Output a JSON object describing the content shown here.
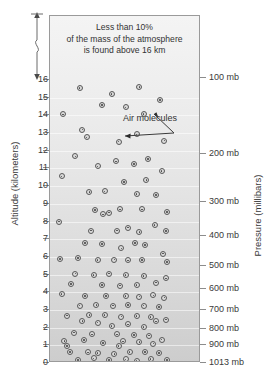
{
  "figure": {
    "annotation_lines": [
      "Less than 10%",
      "of the mass of the atmosphere",
      "is found above 16 km"
    ],
    "molecules_label": "Air molecules"
  },
  "chart_data": {
    "type": "scatter",
    "title": "",
    "subtitle": "",
    "annotation": "Less than 10% of the mass of the atmosphere is found above 16 km",
    "xlabel": "",
    "ylabel": "Altitude (kilometers)",
    "y2label": "Pressure (millibars)",
    "grid": false,
    "legend": "none",
    "ylim": [
      0,
      16
    ],
    "yticks": [
      0,
      1,
      2,
      3,
      4,
      5,
      6,
      7,
      8,
      9,
      10,
      11,
      12,
      13,
      14,
      15,
      16
    ],
    "ytick_labels": [
      "0",
      "1",
      "2",
      "3",
      "4",
      "5",
      "6",
      "7",
      "8",
      "9",
      "10",
      "11",
      "12",
      "13",
      "14",
      "15",
      "16"
    ],
    "y2_ticks_altitude_km": [
      16.1,
      11.8,
      9.1,
      7.2,
      5.5,
      4.2,
      3.0,
      1.9,
      1.0,
      0.0
    ],
    "y2_tick_labels": [
      "100 mb",
      "200 mb",
      "300 mb",
      "400 mb",
      "500 mb",
      "600 mb",
      "700 mb",
      "800 mb",
      "900 mb",
      "1013 mb"
    ],
    "points": [
      [
        0.17,
        15.55
      ],
      [
        0.6,
        15.6
      ],
      [
        0.4,
        15.22
      ],
      [
        0.75,
        14.87
      ],
      [
        0.33,
        14.6
      ],
      [
        0.5,
        14.45
      ],
      [
        0.05,
        14.05
      ],
      [
        0.63,
        14.08
      ],
      [
        0.22,
        12.75
      ],
      [
        0.19,
        13.2
      ],
      [
        0.58,
        12.93
      ],
      [
        0.45,
        12.52
      ],
      [
        0.78,
        12.57
      ],
      [
        0.14,
        11.68
      ],
      [
        0.66,
        11.55
      ],
      [
        0.3,
        11.12
      ],
      [
        0.43,
        11.4
      ],
      [
        0.56,
        11.25
      ],
      [
        0.76,
        10.86
      ],
      [
        0.04,
        10.55
      ],
      [
        0.65,
        10.35
      ],
      [
        0.49,
        10.23
      ],
      [
        0.24,
        9.67
      ],
      [
        0.35,
        9.7
      ],
      [
        0.58,
        9.57
      ],
      [
        0.72,
        9.5
      ],
      [
        0.28,
        8.65
      ],
      [
        0.38,
        8.5
      ],
      [
        0.46,
        8.68
      ],
      [
        0.62,
        8.68
      ],
      [
        0.8,
        8.55
      ],
      [
        0.02,
        8.0
      ],
      [
        0.34,
        8.4
      ],
      [
        0.25,
        7.48
      ],
      [
        0.44,
        7.48
      ],
      [
        0.52,
        7.65
      ],
      [
        0.6,
        7.42
      ],
      [
        0.71,
        7.8
      ],
      [
        0.79,
        7.45
      ],
      [
        0.21,
        6.8
      ],
      [
        0.33,
        6.72
      ],
      [
        0.47,
        6.48
      ],
      [
        0.57,
        6.78
      ],
      [
        0.64,
        6.68
      ],
      [
        0.77,
        6.18
      ],
      [
        0.03,
        5.88
      ],
      [
        0.16,
        5.95
      ],
      [
        0.3,
        5.82
      ],
      [
        0.42,
        5.85
      ],
      [
        0.52,
        5.8
      ],
      [
        0.62,
        5.82
      ],
      [
        0.8,
        5.7
      ],
      [
        0.14,
        5.05
      ],
      [
        0.27,
        4.98
      ],
      [
        0.38,
        5.05
      ],
      [
        0.5,
        4.98
      ],
      [
        0.63,
        4.92
      ],
      [
        0.72,
        4.55
      ],
      [
        0.79,
        4.78
      ],
      [
        0.11,
        4.45
      ],
      [
        0.33,
        4.42
      ],
      [
        0.46,
        4.38
      ],
      [
        0.58,
        4.4
      ],
      [
        0.04,
        3.9
      ],
      [
        0.21,
        3.8
      ],
      [
        0.36,
        3.78
      ],
      [
        0.5,
        3.78
      ],
      [
        0.6,
        3.75
      ],
      [
        0.7,
        3.82
      ],
      [
        0.78,
        3.7
      ],
      [
        0.17,
        3.25
      ],
      [
        0.29,
        3.28
      ],
      [
        0.41,
        3.25
      ],
      [
        0.52,
        3.28
      ],
      [
        0.63,
        3.25
      ],
      [
        0.74,
        3.18
      ],
      [
        0.08,
        2.68
      ],
      [
        0.19,
        2.38
      ],
      [
        0.24,
        2.7
      ],
      [
        0.35,
        2.7
      ],
      [
        0.47,
        2.62
      ],
      [
        0.58,
        2.65
      ],
      [
        0.68,
        2.6
      ],
      [
        0.79,
        2.45
      ],
      [
        0.13,
        1.72
      ],
      [
        0.3,
        2.28
      ],
      [
        0.4,
        2.08
      ],
      [
        0.52,
        2.18
      ],
      [
        0.63,
        2.05
      ],
      [
        0.72,
        2.35
      ],
      [
        0.26,
        1.62
      ],
      [
        0.44,
        1.62
      ],
      [
        0.56,
        1.58
      ],
      [
        0.67,
        1.55
      ],
      [
        0.76,
        1.32
      ],
      [
        0.06,
        1.25
      ],
      [
        0.2,
        1.3
      ],
      [
        0.34,
        1.12
      ],
      [
        0.48,
        1.22
      ],
      [
        0.6,
        1.18
      ],
      [
        0.7,
        1.1
      ],
      [
        0.1,
        0.62
      ],
      [
        0.23,
        0.6
      ],
      [
        0.3,
        0.58
      ],
      [
        0.42,
        0.52
      ],
      [
        0.53,
        0.62
      ],
      [
        0.64,
        0.62
      ],
      [
        0.74,
        0.55
      ],
      [
        0.16,
        0.18
      ],
      [
        0.27,
        0.26
      ],
      [
        0.38,
        0.18
      ],
      [
        0.5,
        0.2
      ],
      [
        0.58,
        0.14
      ],
      [
        0.68,
        0.22
      ],
      [
        0.8,
        0.16
      ],
      [
        0.45,
        0.95
      ],
      [
        0.08,
        0.95
      ]
    ]
  }
}
